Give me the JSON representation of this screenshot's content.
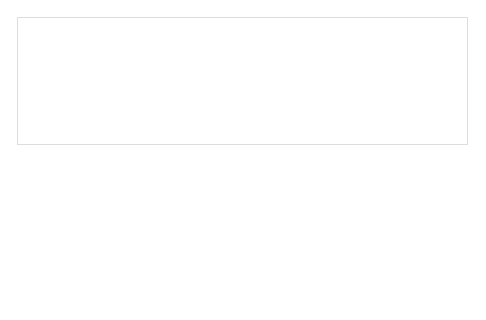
{
  "interventions": {
    "title": "Interventions",
    "items": [
      "Policies",
      "Programs",
      "Information"
    ]
  },
  "outcomes": {
    "title": "Outcomes",
    "items": [
      "Behavioral outcomes",
      "Specific risk factors,",
      "diseases, and conditions",
      "Injuries",
      "Well-being and health-",
      "related quality of life",
      "Health equity"
    ]
  },
  "rings": {
    "outer": "Broad social, economic, cultural, health, and environmental conditions and policies at the global, national, state, and local levels",
    "living": "Living and working conditions",
    "social": "Social, family and community networks",
    "individual": "Individual behavior",
    "core_lines": [
      "Innate individual",
      "traits: age, sex,",
      "race, and",
      "biological",
      "factors"
    ]
  },
  "life_course": "Across life course",
  "footer": {
    "line1": "Assessment, Monitoring,",
    "line2": "Evaluation and Dissemination"
  },
  "colors": {
    "label_bg": "#c6c6c6",
    "ring_outer": "#b5b5b5",
    "ring_living": "#c2c2c2",
    "ring_social": "#cfcfcf",
    "ring_individual": "#e2e2e2",
    "core": "#f4f4f4",
    "arrow": "#bdbdbd"
  }
}
